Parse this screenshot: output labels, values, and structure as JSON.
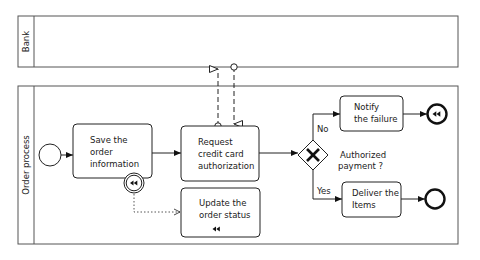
{
  "pools": [
    {
      "id": "bank",
      "label": "Bank"
    },
    {
      "id": "order",
      "label": "Order process"
    }
  ],
  "tasks": [
    {
      "id": "save",
      "lines": [
        "Save the",
        "order",
        "information"
      ]
    },
    {
      "id": "request",
      "lines": [
        "Request",
        "credit card",
        "authorization"
      ]
    },
    {
      "id": "update",
      "lines": [
        "Update the",
        "order status"
      ],
      "marker": "compensation"
    },
    {
      "id": "notify",
      "lines": [
        "Notify",
        "the failure"
      ]
    },
    {
      "id": "deliver",
      "lines": [
        "Deliver the",
        "Items"
      ]
    }
  ],
  "gateway": {
    "type": "exclusive",
    "label_lines": [
      "Authorized",
      "payment ?"
    ]
  },
  "branches": {
    "no": "No",
    "yes": "Yes"
  },
  "events": [
    {
      "id": "start",
      "type": "start"
    },
    {
      "id": "boundary-compensation",
      "type": "boundary-compensation"
    },
    {
      "id": "end-compensation",
      "type": "end-compensation"
    },
    {
      "id": "end",
      "type": "end"
    }
  ],
  "colors": {
    "stroke": "#222222",
    "pool_stroke": "#555555",
    "background": "#ffffff"
  }
}
